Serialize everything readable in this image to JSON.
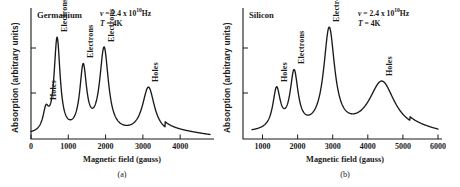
{
  "figure": {
    "panels": [
      {
        "id": "a",
        "title": "Germanium",
        "caption": "(a)",
        "annotation": {
          "frequency_symbol": "ν",
          "frequency_eq": "= 2.4 x 10",
          "frequency_exp": "10",
          "frequency_unit": "Hz",
          "temperature_symbol": "T",
          "temperature_value": "= 4K"
        },
        "xlabel": "Magnetic field (gauss)",
        "ylabel": "Absorption (arbitrary units)",
        "xticks": [
          "0",
          "1000",
          "2000",
          "3000",
          "4000"
        ],
        "peak_labels": [
          "Holes",
          "Electrons",
          "Electrons",
          "Electrons",
          "Holes"
        ]
      },
      {
        "id": "b",
        "title": "Silicon",
        "caption": "(b)",
        "annotation": {
          "frequency_symbol": "ν",
          "frequency_eq": "= 2.4 x 10",
          "frequency_exp": "10",
          "frequency_unit": "Hz",
          "temperature_symbol": "T",
          "temperature_value": "= 4K"
        },
        "xlabel": "Magnetic field (gauss)",
        "ylabel": "Absorption (arbitrary units)",
        "xticks": [
          "1000",
          "2000",
          "3000",
          "4000",
          "5000",
          "6000"
        ],
        "peak_labels": [
          "Holes",
          "Electrons",
          "Electrons",
          "Holes"
        ]
      }
    ]
  },
  "chart_data": [
    {
      "type": "line",
      "title": "Germanium",
      "subtitle": "(a)",
      "xlabel": "Magnetic field (gauss)",
      "ylabel": "Absorption (arbitrary units)",
      "xlim": [
        0,
        4800
      ],
      "ylim": [
        0,
        1.0
      ],
      "xticks": [
        0,
        1000,
        2000,
        3000,
        4000
      ],
      "yticks": [],
      "grid": false,
      "legend": "none",
      "annotations": [
        {
          "text": "ν = 2.4 x 10^10 Hz",
          "x": 2400,
          "y": 0.95
        },
        {
          "text": "T = 4K",
          "x": 2400,
          "y": 0.87
        }
      ],
      "peaks": [
        {
          "label": "Holes",
          "center": 400,
          "height": 0.17,
          "width": 110,
          "carrier": "holes"
        },
        {
          "label": "Electrons",
          "center": 700,
          "height": 0.8,
          "width": 115,
          "carrier": "electrons"
        },
        {
          "label": "Electrons",
          "center": 1400,
          "height": 0.55,
          "width": 130,
          "carrier": "electrons"
        },
        {
          "label": "Electrons",
          "center": 1960,
          "height": 0.72,
          "width": 165,
          "carrier": "electrons"
        },
        {
          "label": "Holes",
          "center": 3150,
          "height": 0.4,
          "width": 230,
          "carrier": "holes"
        }
      ],
      "baseline": 0.03,
      "tail": {
        "from": 3600,
        "to": 4800,
        "level": 0.13
      }
    },
    {
      "type": "line",
      "title": "Silicon",
      "subtitle": "(b)",
      "xlabel": "Magnetic field (gauss)",
      "ylabel": "Absorption (arbitrary units)",
      "xlim": [
        700,
        6000
      ],
      "ylim": [
        0,
        1.0
      ],
      "xticks": [
        1000,
        2000,
        3000,
        4000,
        5000,
        6000
      ],
      "yticks": [],
      "grid": false,
      "legend": "none",
      "annotations": [
        {
          "text": "ν = 2.4 x 10^10 Hz",
          "x": 4700,
          "y": 0.95
        },
        {
          "text": "T = 4K",
          "x": 4700,
          "y": 0.87
        }
      ],
      "peaks": [
        {
          "label": "Holes",
          "center": 1400,
          "height": 0.34,
          "width": 150,
          "carrier": "holes"
        },
        {
          "label": "Electrons",
          "center": 1900,
          "height": 0.48,
          "width": 160,
          "carrier": "electrons"
        },
        {
          "label": "Electrons",
          "center": 2900,
          "height": 0.86,
          "width": 220,
          "carrier": "electrons"
        },
        {
          "label": "Holes",
          "center": 4400,
          "height": 0.43,
          "width": 520,
          "carrier": "holes"
        }
      ],
      "baseline": 0.05,
      "tail": {
        "from": 5200,
        "to": 6000,
        "level": 0.09
      }
    }
  ],
  "style": {
    "line_color": "#1a1a1a",
    "axis_color": "#1a1a1a",
    "background": "#ffffff"
  }
}
